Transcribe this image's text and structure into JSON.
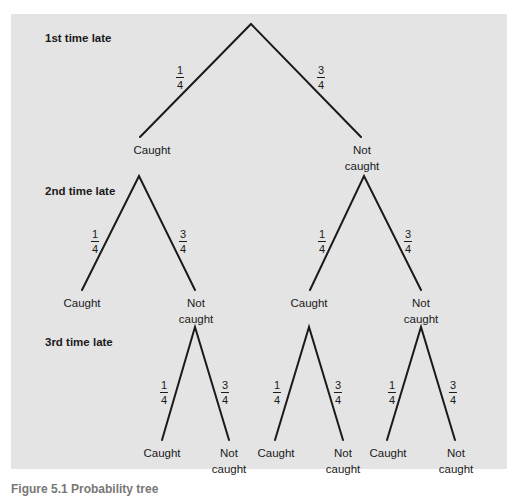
{
  "figure": {
    "level_labels": [
      "1st time late",
      "2nd time late",
      "3rd time late"
    ],
    "caption": "Figure 5.1 Probability tree"
  },
  "probabilities": {
    "caught": {
      "num": "1",
      "den": "4"
    },
    "not_caught": {
      "num": "3",
      "den": "4"
    }
  },
  "nodes": {
    "caught": "Caught",
    "not": "Not",
    "caught_lower": "caught"
  },
  "colors": {
    "panel": "#e4e4e4",
    "line": "#1a1a1a",
    "text": "#1a1a1a"
  },
  "tree": {
    "root": "start",
    "level1": [
      {
        "outcome": "Caught",
        "p": "1/4"
      },
      {
        "outcome": "Not caught",
        "p": "3/4"
      }
    ],
    "level2": [
      {
        "parent": "Caught",
        "outcome": "Caught",
        "p": "1/4"
      },
      {
        "parent": "Caught",
        "outcome": "Not caught",
        "p": "3/4"
      },
      {
        "parent": "Not caught",
        "outcome": "Caught",
        "p": "1/4"
      },
      {
        "parent": "Not caught",
        "outcome": "Not caught",
        "p": "3/4"
      }
    ],
    "level3": [
      {
        "parent": "Caught → Not caught",
        "outcome": "Caught",
        "p": "1/4"
      },
      {
        "parent": "Caught → Not caught",
        "outcome": "Not caught",
        "p": "3/4"
      },
      {
        "parent": "Not caught → Caught",
        "outcome": "Caught",
        "p": "1/4"
      },
      {
        "parent": "Not caught → Caught",
        "outcome": "Not caught",
        "p": "3/4"
      },
      {
        "parent": "Not caught → Not caught",
        "outcome": "Caught",
        "p": "1/4"
      },
      {
        "parent": "Not caught → Not caught",
        "outcome": "Not caught",
        "p": "3/4"
      }
    ]
  }
}
